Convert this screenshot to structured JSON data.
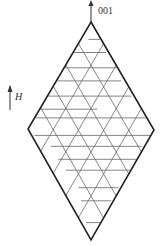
{
  "labels": {
    "axis_top": "001",
    "field": "H"
  },
  "colors": {
    "outline": "#222222",
    "grid": "#555555",
    "wall": "#666666",
    "text": "#333333"
  },
  "lattice": {
    "divisions": 5,
    "description": "Rhombus formed by two equilateral-like triangles with triangular grid lines and horizontal domain-wall segments"
  },
  "walls": [
    {
      "row": 0.08,
      "from": 0.48,
      "to": 0.62
    },
    {
      "row": 0.14,
      "from": 0.35,
      "to": 0.62
    },
    {
      "row": 0.21,
      "from": 0.28,
      "to": 0.72
    },
    {
      "row": 0.27,
      "from": 0.18,
      "to": 0.74
    },
    {
      "row": 0.34,
      "from": 0.12,
      "to": 0.82
    },
    {
      "row": 0.4,
      "from": 0.02,
      "to": 0.55
    },
    {
      "row": 0.44,
      "from": 0.02,
      "to": 0.95
    },
    {
      "row": 0.52,
      "from": 0.05,
      "to": 0.98
    },
    {
      "row": 0.57,
      "from": 0.18,
      "to": 0.9
    },
    {
      "row": 0.63,
      "from": 0.24,
      "to": 0.86
    },
    {
      "row": 0.68,
      "from": 0.3,
      "to": 0.82
    },
    {
      "row": 0.76,
      "from": 0.4,
      "to": 0.72
    },
    {
      "row": 0.82,
      "from": 0.42,
      "to": 0.66
    },
    {
      "row": 0.92,
      "from": 0.46,
      "to": 0.58
    }
  ]
}
